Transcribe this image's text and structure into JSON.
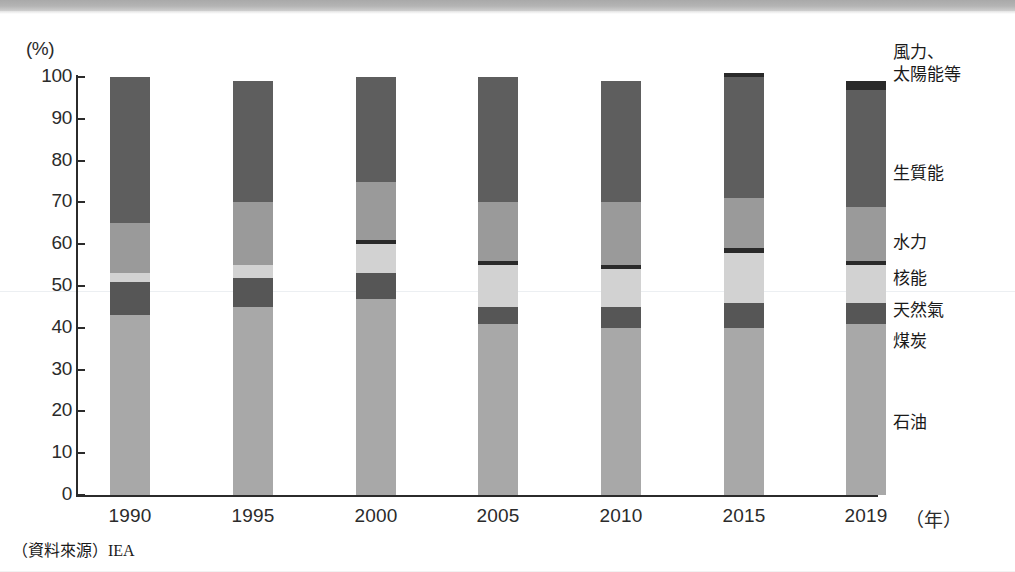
{
  "axis": {
    "y_unit": "(%)",
    "y_ticks": [
      0,
      10,
      20,
      30,
      40,
      50,
      60,
      70,
      80,
      90,
      100
    ],
    "x_categories": [
      "1990",
      "1995",
      "2000",
      "2005",
      "2010",
      "2015",
      "2019"
    ],
    "x_unit": "（年）"
  },
  "source": {
    "label": "（資料來源）",
    "name": "IEA"
  },
  "legend": [
    {
      "key": "wind_solar",
      "label_line1": "風力、",
      "label_line2": "太陽能等",
      "color": "#2a2a2a"
    },
    {
      "key": "biomass",
      "label_line1": "生質能",
      "label_line2": "",
      "color": "#5e5e5e"
    },
    {
      "key": "hydro",
      "label_line1": "水力",
      "label_line2": "",
      "color": "#9a9a9a"
    },
    {
      "key": "nuclear",
      "label_line1": "核能",
      "label_line2": "",
      "color": "#2a2a2a"
    },
    {
      "key": "natural_gas",
      "label_line1": "天然氣",
      "label_line2": "",
      "color": "#d2d2d2"
    },
    {
      "key": "coal",
      "label_line1": "煤炭",
      "label_line2": "",
      "color": "#565656"
    },
    {
      "key": "oil",
      "label_line1": "石油",
      "label_line2": "",
      "color": "#a8a8a8"
    }
  ],
  "chart_data": {
    "type": "bar",
    "stacked": true,
    "title": "",
    "xlabel": "（年）",
    "ylabel": "(%)",
    "ylim": [
      0,
      100
    ],
    "grid": false,
    "legend_position": "right",
    "categories": [
      "1990",
      "1995",
      "2000",
      "2005",
      "2010",
      "2015",
      "2019"
    ],
    "series": [
      {
        "name": "石油",
        "key": "oil",
        "color": "#a8a8a8",
        "values": [
          43,
          45,
          47,
          41,
          40,
          40,
          41
        ]
      },
      {
        "name": "煤炭",
        "key": "coal",
        "color": "#565656",
        "values": [
          8,
          7,
          6,
          4,
          5,
          6,
          5
        ]
      },
      {
        "name": "天然氣",
        "key": "natural_gas",
        "color": "#d2d2d2",
        "values": [
          2,
          3,
          7,
          10,
          9,
          12,
          9
        ]
      },
      {
        "name": "核能",
        "key": "nuclear",
        "color": "#2a2a2a",
        "values": [
          0,
          0,
          1,
          1,
          1,
          1,
          1
        ]
      },
      {
        "name": "水力",
        "key": "hydro",
        "color": "#9a9a9a",
        "values": [
          12,
          15,
          14,
          14,
          15,
          12,
          13
        ]
      },
      {
        "name": "生質能",
        "key": "biomass",
        "color": "#5e5e5e",
        "values": [
          35,
          29,
          25,
          30,
          29,
          29,
          28
        ]
      },
      {
        "name": "風力、太陽能等",
        "key": "wind_solar",
        "color": "#2a2a2a",
        "values": [
          0,
          0,
          0,
          0,
          0,
          1,
          2
        ]
      }
    ],
    "totals": [
      100,
      99,
      100,
      100,
      99,
      101,
      99
    ]
  }
}
